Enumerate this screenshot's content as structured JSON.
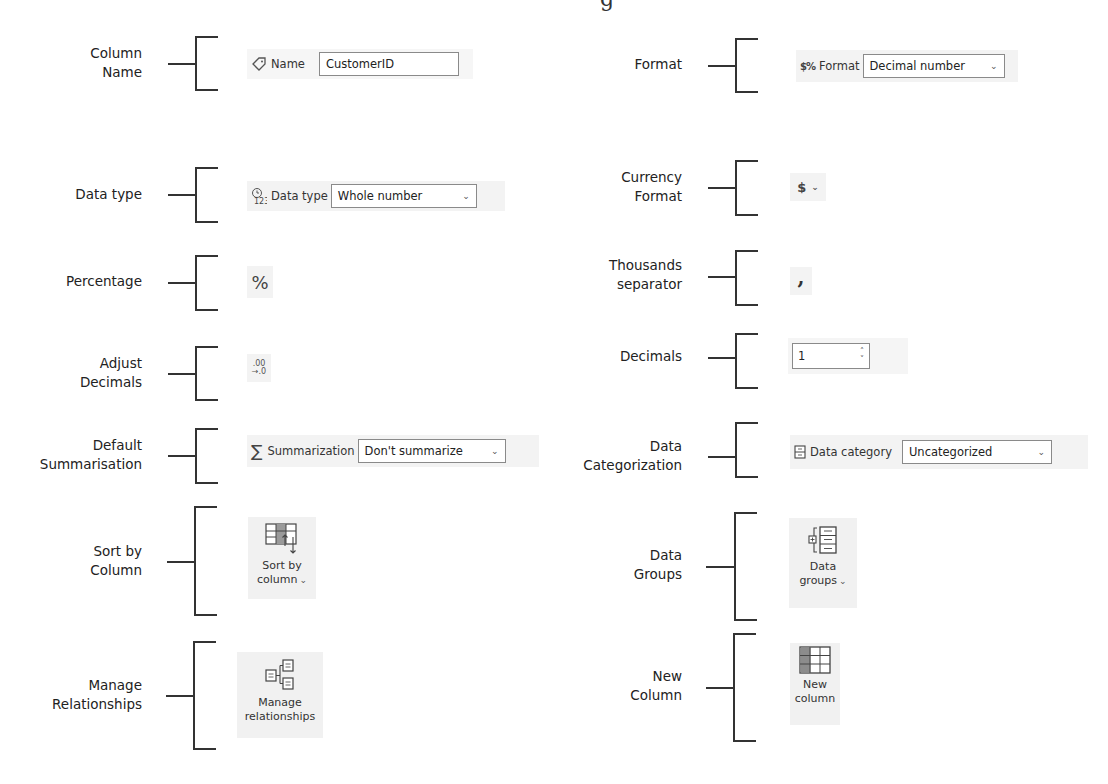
{
  "rows_left": [
    {
      "label": "Column\nName",
      "label_lines": [
        "Column",
        "Name"
      ]
    },
    {
      "label_lines": [
        "Data type"
      ]
    },
    {
      "label_lines": [
        "Percentage"
      ]
    },
    {
      "label_lines": [
        "Adjust",
        "Decimals"
      ]
    },
    {
      "label_lines": [
        "Default",
        "Summarisation"
      ]
    },
    {
      "label_lines": [
        "Sort by",
        "Column"
      ]
    },
    {
      "label_lines": [
        "Manage",
        "Relationships"
      ]
    }
  ],
  "rows_right": [
    {
      "label_lines": [
        "Format"
      ]
    },
    {
      "label_lines": [
        "Currency",
        "Format"
      ]
    },
    {
      "label_lines": [
        "Thousands",
        "separator"
      ]
    },
    {
      "label_lines": [
        "Decimals"
      ]
    },
    {
      "label_lines": [
        "Data",
        "Categorization"
      ]
    },
    {
      "label_lines": [
        "Data",
        "Groups"
      ]
    },
    {
      "label_lines": [
        "New",
        "Column"
      ]
    }
  ],
  "widgets": {
    "name": {
      "label": "Name",
      "value": "CustomerID",
      "icon": "tag-icon"
    },
    "data_type": {
      "label": "Data type",
      "value": "Whole number",
      "icon": "data-type-icon"
    },
    "percentage": {
      "symbol": "%",
      "icon": "percent-icon"
    },
    "adjust_decimals": {
      "top": ".00",
      "bottom": "→.0",
      "icon": "decrease-decimal-icon"
    },
    "summarization": {
      "label": "Summarization",
      "value": "Don't summarize",
      "icon": "sigma-icon",
      "symbol": "∑"
    },
    "sort_by_column": {
      "line1": "Sort by",
      "line2": "column",
      "icon": "sort-by-column-icon"
    },
    "manage_relationships": {
      "line1": "Manage",
      "line2": "relationships",
      "icon": "relationships-icon"
    },
    "format": {
      "label": "Format",
      "value": "Decimal number",
      "icon": "format-icon",
      "symbol": "$%"
    },
    "currency": {
      "symbol": "$",
      "icon": "currency-icon"
    },
    "thousands": {
      "symbol": ",",
      "icon": "comma-icon"
    },
    "decimals": {
      "value": "1",
      "up": "˄",
      "down": "˅"
    },
    "data_category": {
      "label": "Data category",
      "value": "Uncategorized",
      "icon": "data-category-icon"
    },
    "data_groups": {
      "line1": "Data",
      "line2": "groups",
      "icon": "data-groups-icon"
    },
    "new_column": {
      "line1": "New",
      "line2": "column",
      "icon": "new-column-icon"
    }
  },
  "chevron": "⌄"
}
